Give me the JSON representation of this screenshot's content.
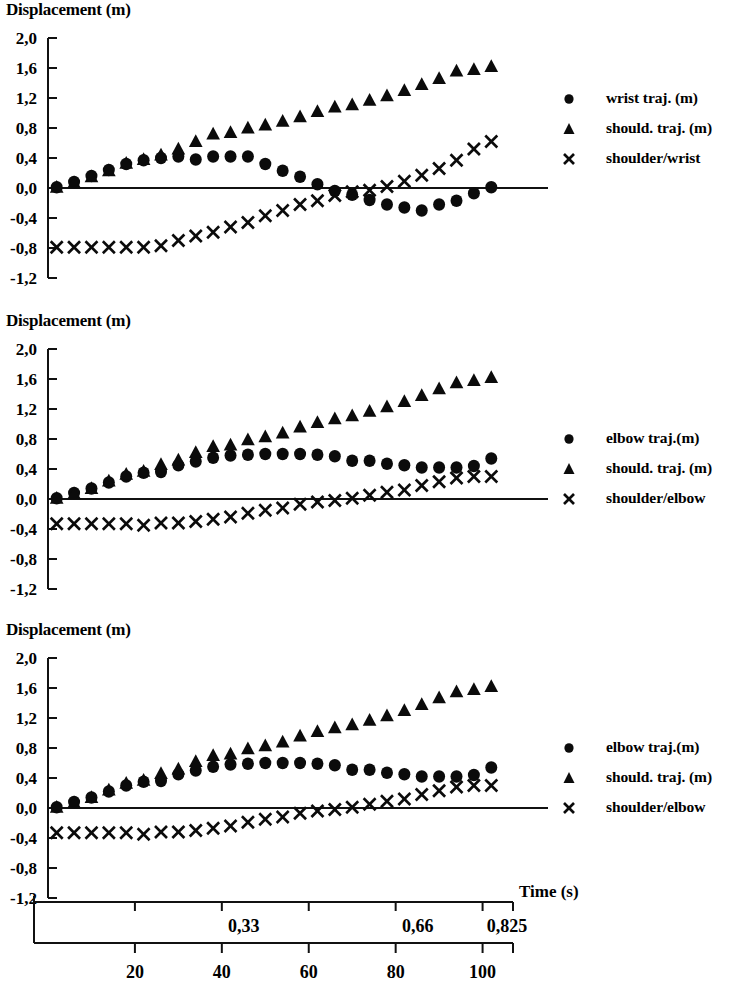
{
  "figure": {
    "width": 741,
    "height": 999,
    "background": "#ffffff",
    "ink_color": "#0b0b0b"
  },
  "axis_common": {
    "ylabel": "Displacement (m)",
    "ytick_labels": [
      "2,0",
      "1,6",
      "1,2",
      "0,8",
      "0,4",
      "0,0",
      "-0,4",
      "-0,8",
      "-1,2"
    ],
    "ytick_values": [
      2.0,
      1.6,
      1.2,
      0.8,
      0.4,
      0.0,
      -0.4,
      -0.8,
      -1.2
    ],
    "ylim": [
      -1.2,
      2.0
    ],
    "xlim": [
      0,
      107
    ],
    "grid": false,
    "legend_position": "right"
  },
  "bottom_axis": {
    "time_axis_label": "Time (s)",
    "time_tick_labels": [
      "0,33",
      "0,66",
      "0,825"
    ],
    "time_tick_values": [
      0.33,
      0.66,
      0.825
    ],
    "frame_tick_labels": [
      "20",
      "40",
      "60",
      "80",
      "100"
    ],
    "frame_tick_values": [
      20,
      40,
      60,
      80,
      100
    ]
  },
  "chart_data": [
    {
      "id": "panel-1",
      "type": "scatter",
      "title": "Displacement (m)",
      "xlabel": "",
      "ylabel": "Displacement (m)",
      "ylim": [
        -1.2,
        2.0
      ],
      "xlim": [
        0,
        107
      ],
      "grid": false,
      "legend": [
        "wrist traj. (m)",
        "should. traj. (m)",
        "shoulder/wrist"
      ],
      "x": [
        2,
        6,
        10,
        14,
        18,
        22,
        26,
        30,
        34,
        38,
        42,
        46,
        50,
        54,
        58,
        62,
        66,
        70,
        74,
        78,
        82,
        86,
        90,
        94,
        98,
        102
      ],
      "series": [
        {
          "name": "wrist traj. (m)",
          "marker": "circle",
          "values": [
            0.01,
            0.08,
            0.16,
            0.24,
            0.32,
            0.37,
            0.4,
            0.42,
            0.38,
            0.42,
            0.42,
            0.42,
            0.32,
            0.23,
            0.15,
            0.05,
            -0.04,
            -0.09,
            -0.16,
            -0.22,
            -0.26,
            -0.3,
            -0.22,
            -0.17,
            -0.07,
            0.01
          ]
        },
        {
          "name": "should. traj. (m)",
          "marker": "triangle",
          "values": [
            0.01,
            0.07,
            0.15,
            0.23,
            0.33,
            0.38,
            0.44,
            0.52,
            0.62,
            0.72,
            0.74,
            0.8,
            0.84,
            0.89,
            0.95,
            1.02,
            1.08,
            1.11,
            1.17,
            1.23,
            1.3,
            1.38,
            1.46,
            1.56,
            1.58,
            1.62
          ]
        },
        {
          "name": "shoulder/wrist",
          "marker": "cross",
          "values": [
            -0.79,
            -0.79,
            -0.79,
            -0.79,
            -0.79,
            -0.79,
            -0.77,
            -0.7,
            -0.64,
            -0.59,
            -0.52,
            -0.46,
            -0.37,
            -0.3,
            -0.22,
            -0.17,
            -0.1,
            -0.05,
            -0.03,
            0.02,
            0.09,
            0.17,
            0.26,
            0.37,
            0.52,
            0.62
          ]
        }
      ]
    },
    {
      "id": "panel-2",
      "type": "scatter",
      "title": "Displacement (m)",
      "xlabel": "",
      "ylabel": "Displacement (m)",
      "ylim": [
        -1.2,
        2.0
      ],
      "xlim": [
        0,
        107
      ],
      "grid": false,
      "legend": [
        "elbow traj.(m)",
        "should. traj. (m)",
        "shoulder/elbow"
      ],
      "x": [
        2,
        6,
        10,
        14,
        18,
        22,
        26,
        30,
        34,
        38,
        42,
        46,
        50,
        54,
        58,
        62,
        66,
        70,
        74,
        78,
        82,
        86,
        90,
        94,
        98,
        102
      ],
      "series": [
        {
          "name": "elbow traj.(m)",
          "marker": "circle",
          "values": [
            0.01,
            0.08,
            0.14,
            0.22,
            0.3,
            0.35,
            0.36,
            0.45,
            0.5,
            0.55,
            0.58,
            0.59,
            0.6,
            0.6,
            0.6,
            0.59,
            0.57,
            0.51,
            0.51,
            0.47,
            0.45,
            0.42,
            0.42,
            0.42,
            0.44,
            0.54
          ]
        },
        {
          "name": "should. traj. (m)",
          "marker": "triangle",
          "values": [
            0.01,
            0.07,
            0.14,
            0.24,
            0.33,
            0.37,
            0.46,
            0.52,
            0.62,
            0.7,
            0.72,
            0.79,
            0.83,
            0.88,
            0.96,
            1.02,
            1.07,
            1.11,
            1.17,
            1.23,
            1.3,
            1.38,
            1.47,
            1.55,
            1.58,
            1.62
          ]
        },
        {
          "name": "shoulder/elbow",
          "marker": "cross",
          "values": [
            -0.33,
            -0.33,
            -0.33,
            -0.33,
            -0.33,
            -0.35,
            -0.32,
            -0.32,
            -0.3,
            -0.27,
            -0.24,
            -0.19,
            -0.15,
            -0.12,
            -0.07,
            -0.04,
            -0.02,
            0.01,
            0.05,
            0.09,
            0.12,
            0.18,
            0.23,
            0.28,
            0.3,
            0.3
          ]
        }
      ]
    },
    {
      "id": "panel-3",
      "type": "scatter",
      "title": "Displacement (m)",
      "xlabel": "Time (s)",
      "ylabel": "Displacement (m)",
      "ylim": [
        -1.2,
        2.0
      ],
      "xlim": [
        0,
        107
      ],
      "grid": false,
      "legend": [
        "elbow traj.(m)",
        "should. traj. (m)",
        "shoulder/elbow"
      ],
      "x": [
        2,
        6,
        10,
        14,
        18,
        22,
        26,
        30,
        34,
        38,
        42,
        46,
        50,
        54,
        58,
        62,
        66,
        70,
        74,
        78,
        82,
        86,
        90,
        94,
        98,
        102
      ],
      "series": [
        {
          "name": "elbow traj.(m)",
          "marker": "circle",
          "values": [
            0.01,
            0.08,
            0.14,
            0.22,
            0.3,
            0.35,
            0.36,
            0.45,
            0.5,
            0.55,
            0.58,
            0.59,
            0.6,
            0.6,
            0.6,
            0.59,
            0.57,
            0.51,
            0.51,
            0.47,
            0.45,
            0.42,
            0.42,
            0.42,
            0.44,
            0.54
          ]
        },
        {
          "name": "should. traj. (m)",
          "marker": "triangle",
          "values": [
            0.01,
            0.07,
            0.14,
            0.24,
            0.33,
            0.37,
            0.46,
            0.52,
            0.62,
            0.7,
            0.72,
            0.79,
            0.83,
            0.88,
            0.96,
            1.02,
            1.07,
            1.11,
            1.17,
            1.23,
            1.3,
            1.38,
            1.47,
            1.55,
            1.58,
            1.62
          ]
        },
        {
          "name": "shoulder/elbow",
          "marker": "cross",
          "values": [
            -0.33,
            -0.33,
            -0.33,
            -0.33,
            -0.33,
            -0.35,
            -0.32,
            -0.32,
            -0.3,
            -0.27,
            -0.24,
            -0.19,
            -0.15,
            -0.12,
            -0.07,
            -0.04,
            -0.02,
            0.01,
            0.05,
            0.09,
            0.12,
            0.18,
            0.23,
            0.28,
            0.3,
            0.3
          ]
        }
      ]
    }
  ]
}
